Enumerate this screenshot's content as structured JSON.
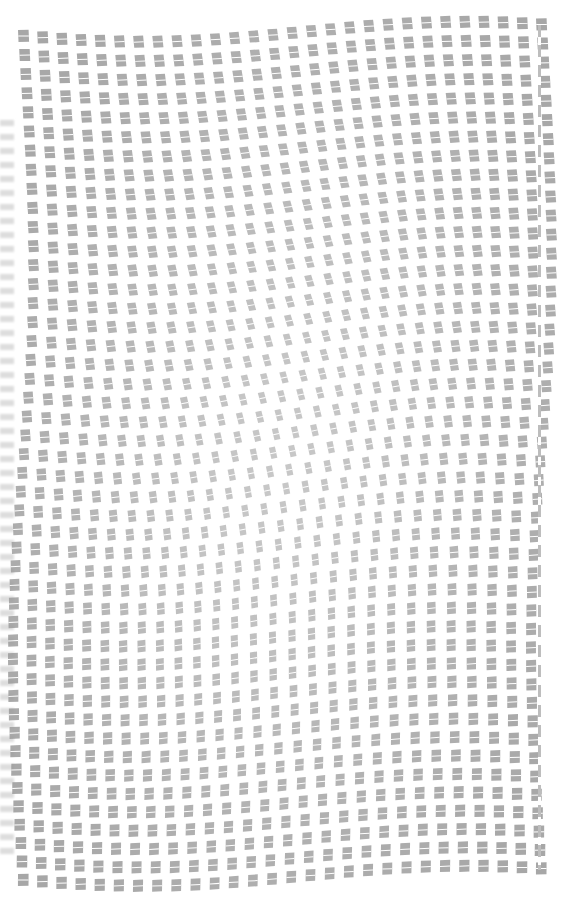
{
  "image": {
    "description": "warped grid of small gray text-like tiles",
    "background": "#ffffff",
    "tile_color": "#9a9a9a",
    "tile_line_color": "#ffffff"
  },
  "grid": {
    "cols": 28,
    "rows": 46,
    "left": 18,
    "top": 26,
    "width": 518,
    "height": 844,
    "tile_w": 11,
    "tile_h": 12,
    "warp_amplitude_x": 14,
    "warp_amplitude_y": 10,
    "skew_strength": 0.55
  }
}
